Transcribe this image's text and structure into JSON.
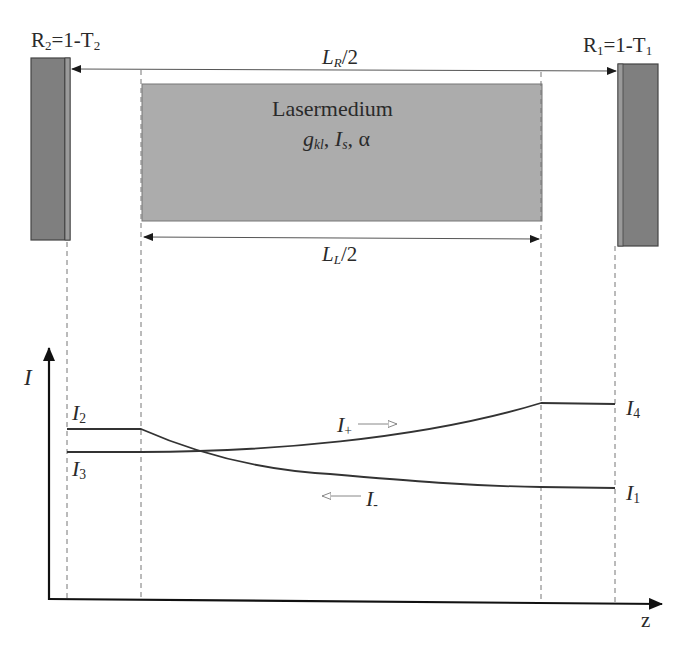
{
  "diagram": {
    "mirror_left": {
      "label_R": "R",
      "label_R_sub": "2",
      "label_rest": "=1-T",
      "label_T_sub": "2"
    },
    "mirror_right": {
      "label_R": "R",
      "label_R_sub": "1",
      "label_rest": "=1-T",
      "label_T_sub": "1"
    },
    "resonator_length": {
      "symbol": "L",
      "sub": "R",
      "suffix": "/2"
    },
    "medium": {
      "title": "Lasermedium",
      "params": {
        "g": "g",
        "g_sub": "kl",
        "sep1": ", ",
        "I": "I",
        "I_sub": "s",
        "sep2": ", ",
        "alpha": "α"
      },
      "fill": "#acacac"
    },
    "medium_length": {
      "symbol": "L",
      "sub": "L",
      "suffix": "/2"
    },
    "mirror_fill": "#7f7f7f"
  },
  "plot": {
    "y_axis_label": "I",
    "x_axis_label": "z",
    "labels": {
      "I2": {
        "sym": "I",
        "sub": "2"
      },
      "I3": {
        "sym": "I",
        "sub": "3"
      },
      "I4": {
        "sym": "I",
        "sub": "4"
      },
      "I1": {
        "sym": "I",
        "sub": "1"
      },
      "Iplus": {
        "sym": "I",
        "sub": "+"
      },
      "Iminus": {
        "sym": "I",
        "sub": "-"
      }
    }
  }
}
